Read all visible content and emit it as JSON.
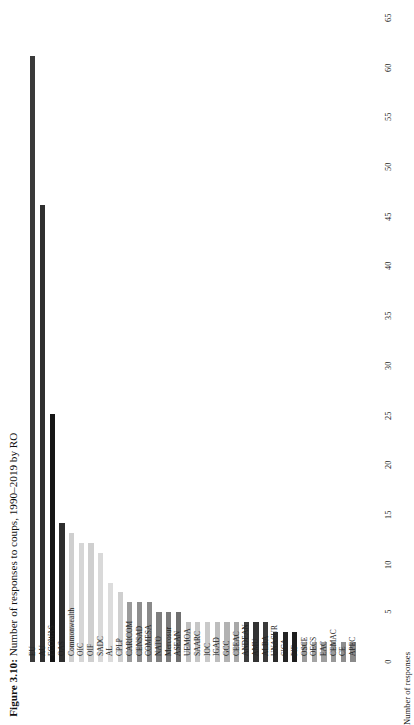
{
  "figure": {
    "caption_lead": "Figure 3.10:",
    "caption_rest": " Number of responses to coups, 1990–2019 by RO"
  },
  "chart_data": {
    "type": "bar",
    "title": "Figure 3.10: Number of responses to coups, 1990–2019 by RO",
    "xlabel": "",
    "ylabel": "Number of responses",
    "ylim": [
      0,
      65
    ],
    "yticks": [
      0,
      5,
      10,
      15,
      20,
      25,
      30,
      35,
      40,
      45,
      50,
      55,
      60,
      65
    ],
    "grid": false,
    "orientation": "vertical-bars-rotated-page",
    "categories": [
      "EU",
      "AU",
      "ECOWAS",
      "OAS",
      "Commonwealth",
      "OIC",
      "OIF",
      "SADC",
      "AL",
      "CPLP",
      "CARICOM",
      "CENSAD",
      "COMESA",
      "NATO",
      "Mercosur",
      "ASEAN",
      "UEMOA",
      "SAARC",
      "IOC",
      "IGAD",
      "GCC",
      "CEEAC",
      "ANDEAN",
      "AMU",
      "ALBA",
      "UNASUR",
      "SICA",
      "PIF",
      "OSCE",
      "OECS",
      "EAC",
      "CEMAC",
      "CE",
      "APEC"
    ],
    "values": [
      61,
      46,
      25,
      14,
      13,
      12,
      12,
      11,
      8,
      7,
      6,
      6,
      6,
      5,
      5,
      5,
      4,
      4,
      4,
      4,
      4,
      4,
      4,
      4,
      4,
      3,
      3,
      3,
      2,
      2,
      2,
      2,
      2,
      2
    ],
    "colors": [
      "#3a3a3a",
      "#2f2f2f",
      "#151515",
      "#2e2e2e",
      "#cfcfcf",
      "#d6d6d6",
      "#cfcfcf",
      "#d9d9d9",
      "#dcdcdc",
      "#cfcfcf",
      "#9a9a9a",
      "#8e8e8e",
      "#8a8a8a",
      "#7e7e7e",
      "#7a7a7a",
      "#6f6f6f",
      "#bfbfbf",
      "#c6c6c6",
      "#c9c9c9",
      "#bdbdbd",
      "#b2b2b2",
      "#a8a8a8",
      "#3d3d3d",
      "#333333",
      "#3a3a3a",
      "#2b2b2b",
      "#242424",
      "#1e1e1e",
      "#9a9a9a",
      "#a4a4a4",
      "#9e9e9e",
      "#989898",
      "#8e8e8e",
      "#8a8a8a"
    ]
  }
}
